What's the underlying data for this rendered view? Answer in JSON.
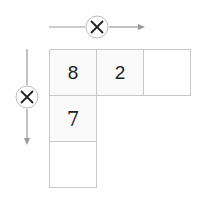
{
  "diagram": {
    "type": "multiplication-grid",
    "horizontal_operator": "×",
    "vertical_operator": "×",
    "cells": {
      "r0c0": "8",
      "r0c1": "2",
      "r0c2": "",
      "r1c0": "7",
      "r2c0": ""
    },
    "colors": {
      "line": "#999999",
      "cell_border": "#c8c8c8",
      "text": "#222222"
    }
  }
}
